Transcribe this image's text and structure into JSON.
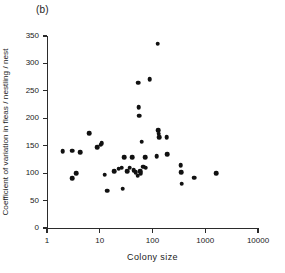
{
  "figure": {
    "panel_label": "(b)",
    "xlabel": "Colony size",
    "ylabel": "Coefficient of variation in fleas / nestling / nest"
  },
  "chart_data": {
    "type": "scatter",
    "title": "",
    "panel": "(b)",
    "xlabel": "Colony size",
    "ylabel": "Coefficient of variation in fleas / nestling / nest",
    "xscale": "log",
    "yscale": "linear",
    "xlim": [
      1,
      10000
    ],
    "ylim": [
      0,
      350
    ],
    "xticks": [
      1,
      10,
      100,
      1000,
      10000
    ],
    "xtick_labels": [
      "1",
      "10",
      "100",
      "1000",
      "10000"
    ],
    "yticks": [
      0,
      50,
      100,
      150,
      200,
      250,
      300,
      350
    ],
    "ytick_labels": [
      "0",
      "50",
      "100",
      "150",
      "200",
      "250",
      "300",
      "350"
    ],
    "grid": false,
    "legend": false,
    "marker": "filled-circle",
    "marker_color": "#111111",
    "n_points": 42,
    "points": [
      {
        "x": 2.0,
        "y": 140
      },
      {
        "x": 3.0,
        "y": 141
      },
      {
        "x": 3.0,
        "y": 91
      },
      {
        "x": 3.6,
        "y": 100
      },
      {
        "x": 4.3,
        "y": 138
      },
      {
        "x": 6.3,
        "y": 173
      },
      {
        "x": 9.0,
        "y": 147
      },
      {
        "x": 10.5,
        "y": 152
      },
      {
        "x": 10.8,
        "y": 155
      },
      {
        "x": 12.5,
        "y": 97
      },
      {
        "x": 14.0,
        "y": 68
      },
      {
        "x": 19.0,
        "y": 103
      },
      {
        "x": 23.0,
        "y": 108
      },
      {
        "x": 26.0,
        "y": 110
      },
      {
        "x": 27.0,
        "y": 72
      },
      {
        "x": 29.0,
        "y": 129
      },
      {
        "x": 33.0,
        "y": 104
      },
      {
        "x": 37.0,
        "y": 110
      },
      {
        "x": 41.0,
        "y": 129
      },
      {
        "x": 44.0,
        "y": 105
      },
      {
        "x": 48.0,
        "y": 102
      },
      {
        "x": 52.0,
        "y": 95
      },
      {
        "x": 54.0,
        "y": 265
      },
      {
        "x": 55.0,
        "y": 220
      },
      {
        "x": 56.0,
        "y": 205
      },
      {
        "x": 58.0,
        "y": 103
      },
      {
        "x": 60.0,
        "y": 100
      },
      {
        "x": 62.0,
        "y": 157
      },
      {
        "x": 66.0,
        "y": 112
      },
      {
        "x": 72.0,
        "y": 129
      },
      {
        "x": 74.0,
        "y": 110
      },
      {
        "x": 88.0,
        "y": 271
      },
      {
        "x": 125.0,
        "y": 336
      },
      {
        "x": 120.0,
        "y": 131
      },
      {
        "x": 128.0,
        "y": 178
      },
      {
        "x": 130.0,
        "y": 172
      },
      {
        "x": 133.0,
        "y": 166
      },
      {
        "x": 185.0,
        "y": 166
      },
      {
        "x": 190.0,
        "y": 135
      },
      {
        "x": 340.0,
        "y": 114
      },
      {
        "x": 350.0,
        "y": 102
      },
      {
        "x": 355.0,
        "y": 81
      },
      {
        "x": 620.0,
        "y": 92
      },
      {
        "x": 1600.0,
        "y": 100
      }
    ]
  }
}
